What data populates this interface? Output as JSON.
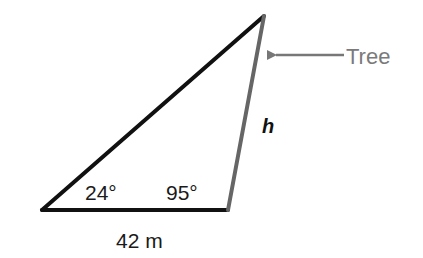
{
  "diagram": {
    "type": "triangle",
    "vertices": {
      "left": [
        42,
        210
      ],
      "right": [
        228,
        210
      ],
      "top": [
        264,
        16
      ]
    },
    "labels": {
      "angle_left": "24°",
      "angle_right": "95°",
      "base": "42 m",
      "height_side": "h",
      "pointer": "Tree"
    },
    "colors": {
      "triangle_stroke": "#111111",
      "tree_side": "#666666",
      "pointer": "#777777"
    }
  }
}
